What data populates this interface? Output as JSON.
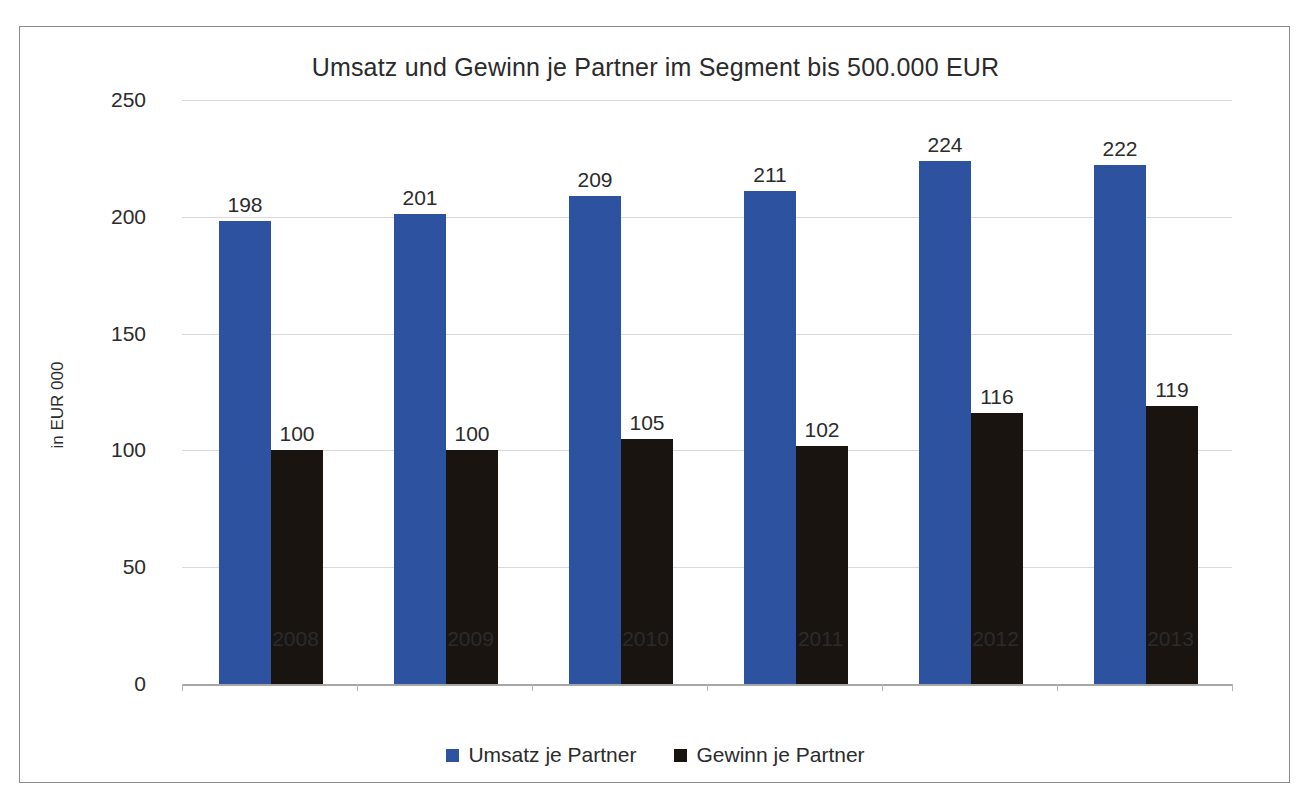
{
  "chart_data": {
    "type": "bar",
    "title": "Umsatz und Gewinn je Partner im Segment bis 500.000 EUR",
    "xlabel": "",
    "ylabel": "in EUR 000",
    "categories": [
      "2008",
      "2009",
      "2010",
      "2011",
      "2012",
      "2013"
    ],
    "series": [
      {
        "name": "Umsatz je Partner",
        "color": "#2c52a0",
        "values": [
          198,
          201,
          209,
          211,
          224,
          222
        ]
      },
      {
        "name": "Gewinn je Partner",
        "color": "#1a1411",
        "values": [
          100,
          100,
          105,
          102,
          116,
          119
        ]
      }
    ],
    "ylim": [
      0,
      250
    ],
    "yticks": [
      0,
      50,
      100,
      150,
      200,
      250
    ],
    "ytick_labels": [
      "0",
      "50",
      "100",
      "150",
      "200",
      "250"
    ],
    "grid": true,
    "data_labels": true,
    "legend_position": "bottom"
  },
  "frame": {
    "border_color": "#8c8c8c",
    "background": "#ffffff"
  }
}
